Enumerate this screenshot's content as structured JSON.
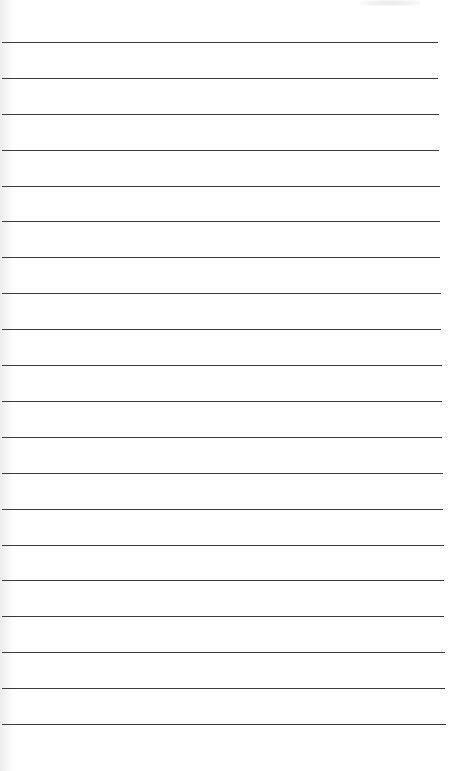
{
  "document": {
    "type": "lined-paper",
    "line_count": 20,
    "first_line_y": 42,
    "last_line_y": 724,
    "line_color": "#3a3a3a",
    "paper_color": "#ffffff"
  }
}
